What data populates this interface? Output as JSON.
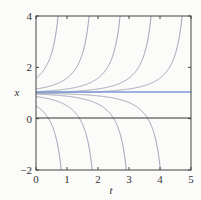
{
  "chart_data": {
    "type": "line",
    "title": "",
    "xlabel": "t",
    "ylabel": "x",
    "xlim": [
      0,
      5
    ],
    "ylim": [
      -2,
      4
    ],
    "xticks": [
      "0",
      "1",
      "2",
      "3",
      "4",
      "5"
    ],
    "yticks": [
      "-2",
      "0",
      "2",
      "4"
    ],
    "grid": false,
    "legend": null,
    "series": [
      {
        "name": "equilibrium x=1",
        "color": "#7f98d6",
        "points": [
          [
            0,
            1
          ],
          [
            5,
            1
          ]
        ]
      },
      {
        "name": "axis x=0",
        "color": "#333333",
        "points": [
          [
            0,
            0
          ],
          [
            5,
            0
          ]
        ]
      },
      {
        "name": "upper-1",
        "color": "#9aa0b8",
        "blowup_t": 1.0,
        "x0": 1.8
      },
      {
        "name": "upper-2",
        "color": "#9aa0b8",
        "blowup_t": 2.0,
        "x0": 1.4
      },
      {
        "name": "upper-3",
        "color": "#9aa0b8",
        "blowup_t": 3.0,
        "x0": 1.2
      },
      {
        "name": "upper-4",
        "color": "#9aa0b8",
        "blowup_t": 4.0,
        "x0": 1.1
      },
      {
        "name": "upper-5",
        "color": "#9aa0b8",
        "blowup_t": 5.0,
        "x0": 1.04
      },
      {
        "name": "lower-1",
        "color": "#9aa0b8",
        "blowdown_t": 1.1,
        "x0": 0.4
      },
      {
        "name": "lower-2",
        "color": "#9aa0b8",
        "blowdown_t": 2.1,
        "x0": 0.7
      },
      {
        "name": "lower-3",
        "color": "#9aa0b8",
        "blowdown_t": 3.2,
        "x0": 0.85
      },
      {
        "name": "lower-4",
        "color": "#9aa0b8",
        "blowdown_t": 4.3,
        "x0": 0.93
      }
    ]
  }
}
